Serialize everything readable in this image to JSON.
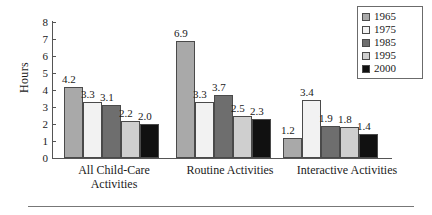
{
  "chart_data": {
    "type": "bar",
    "title": "",
    "xlabel": "",
    "ylabel": "Hours",
    "ylim": [
      0,
      8
    ],
    "yticks": [
      8,
      7,
      6,
      5,
      4,
      3,
      2,
      1,
      0
    ],
    "grid": false,
    "legend_position": "top-right",
    "categories": [
      "All Child-Care Activities",
      "Routine Activities",
      "Interactive Activities"
    ],
    "series": [
      {
        "name": "1965",
        "color": "#a9a9a9",
        "values": [
          4.2,
          6.9,
          1.2
        ]
      },
      {
        "name": "1975",
        "color": "#f2f2f2",
        "values": [
          3.3,
          3.3,
          3.4
        ]
      },
      {
        "name": "1985",
        "color": "#6e6e6e",
        "values": [
          3.1,
          3.7,
          1.9
        ]
      },
      {
        "name": "1995",
        "color": "#cfcfcf",
        "values": [
          2.2,
          2.5,
          1.8
        ]
      },
      {
        "name": "2000",
        "color": "#111111",
        "values": [
          2.0,
          2.3,
          1.4
        ]
      }
    ],
    "value_labels": [
      [
        "4.2",
        "3.3",
        "3.1",
        "2.2",
        "2.0"
      ],
      [
        "6.9",
        "3.3",
        "3.7",
        "2.5",
        "2.3"
      ],
      [
        "1.2",
        "3.4",
        "1.9",
        "1.8",
        "1.4"
      ]
    ]
  },
  "axis": {
    "y_label": "Hours",
    "y_ticks": [
      "8",
      "7",
      "6",
      "5",
      "4",
      "3",
      "2",
      "1",
      "0"
    ]
  },
  "categories": {
    "group1_line1": "All Child-Care",
    "group1_line2": "Activities",
    "group2_line1": "Routine Activities",
    "group3_line1": "Interactive Activities"
  },
  "legend": {
    "items": [
      {
        "label": "1965",
        "color": "#a9a9a9"
      },
      {
        "label": "1975",
        "color": "#f2f2f2"
      },
      {
        "label": "1985",
        "color": "#6e6e6e"
      },
      {
        "label": "1995",
        "color": "#cfcfcf"
      },
      {
        "label": "2000",
        "color": "#111111"
      }
    ]
  }
}
